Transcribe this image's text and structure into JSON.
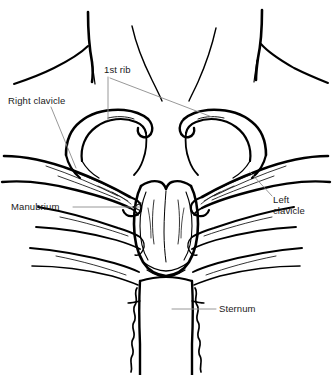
{
  "figure": {
    "kind": "anatomical-line-drawing",
    "background_color": "#ffffff",
    "ink_color": "#000000",
    "leader_color": "#8c8c8c",
    "label_color": "#1a1a1a"
  },
  "labels": {
    "first_rib": "1st rib",
    "right_clavicle": "Right clavicle",
    "manubrium": "Manubrium",
    "left_clavicle_line1": "Left",
    "left_clavicle_line2": "clavicle",
    "sternum": "Sternum"
  },
  "caption": ""
}
